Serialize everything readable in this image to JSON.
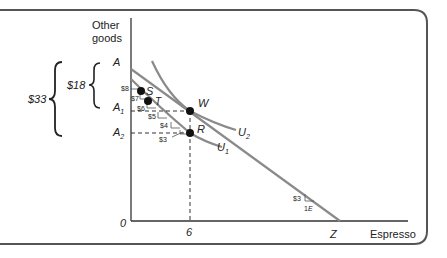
{
  "axes": {
    "y_label_line1": "Other",
    "y_label_line2": "goods",
    "x_label": "Espresso",
    "origin": "0",
    "x_tick": "6"
  },
  "points": {
    "A": "A",
    "A1": "A",
    "A1_sub": "1",
    "A2": "A",
    "A2_sub": "2",
    "S": "S",
    "T": "T",
    "W": "W",
    "R": "R",
    "Z": "Z"
  },
  "curves": {
    "U1": "U",
    "U1_sub": "1",
    "U2": "U",
    "U2_sub": "2"
  },
  "braces": {
    "inner": "$18",
    "outer": "$33"
  },
  "step_labels": [
    "$8",
    "$7",
    "$6",
    "$5",
    "$4",
    "$3"
  ],
  "slope_note": {
    "price": "$3",
    "unit": "1",
    "unit_letter": "E"
  },
  "colors": {
    "curve": "#8a8a8a",
    "axis": "#333333",
    "frame": "#555555",
    "dot": "#111111"
  }
}
